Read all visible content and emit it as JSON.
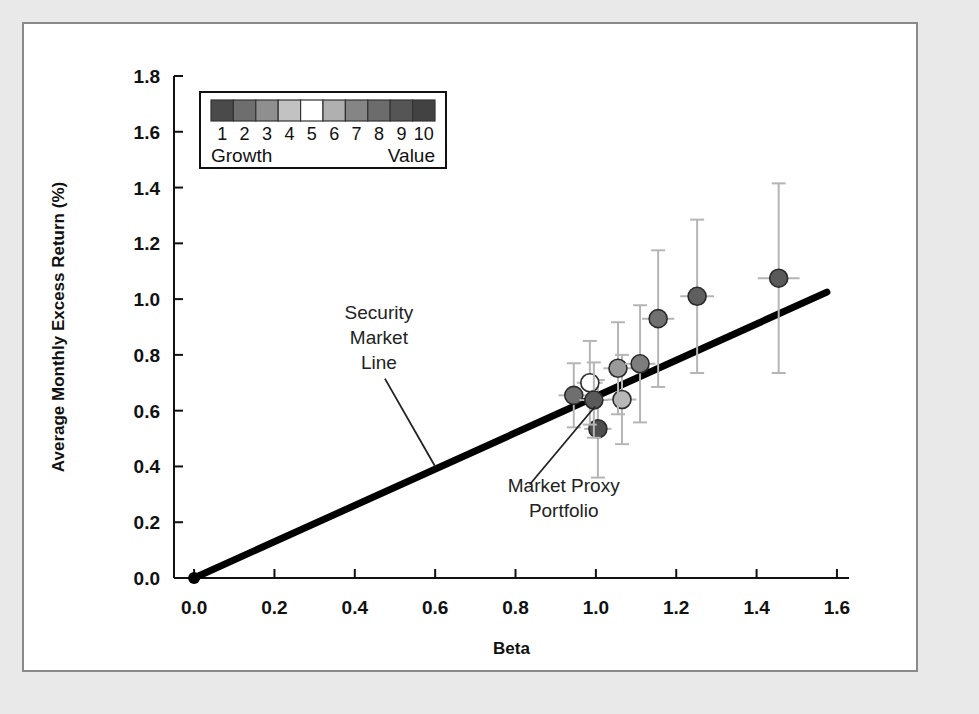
{
  "figure": {
    "background_color": "#e9e9e9",
    "panel_color": "#ffffff",
    "panel_border_color": "#8a8a8a"
  },
  "chart_data": {
    "type": "scatter",
    "title": "",
    "xlabel": "Beta",
    "ylabel": "Average Monthly Excess Return (%)",
    "xlim": [
      -0.05,
      1.63
    ],
    "ylim": [
      0.0,
      1.8
    ],
    "xticks": [
      "0.0",
      "0.2",
      "0.4",
      "0.6",
      "0.8",
      "1.0",
      "1.2",
      "1.4",
      "1.6"
    ],
    "xtick_values": [
      0.0,
      0.2,
      0.4,
      0.6,
      0.8,
      1.0,
      1.2,
      1.4,
      1.6
    ],
    "yticks": [
      "0.0",
      "0.2",
      "0.4",
      "0.6",
      "0.8",
      "1.0",
      "1.2",
      "1.4",
      "1.6",
      "1.8"
    ],
    "ytick_values": [
      0.0,
      0.2,
      0.4,
      0.6,
      0.8,
      1.0,
      1.2,
      1.4,
      1.6,
      1.8
    ],
    "grid": false,
    "legend_position": "upper-left-inside",
    "series": [
      {
        "name": "Book-to-market decile portfolios",
        "points": [
          {
            "decile": 1,
            "x": 0.945,
            "y": 0.655,
            "xerr": 0.038,
            "yerr": 0.115,
            "shade": "#6f6f6f"
          },
          {
            "decile": 2,
            "x": 1.005,
            "y": 0.535,
            "xerr": 0.034,
            "yerr": 0.175,
            "shade": "#4e4e4e"
          },
          {
            "decile": 3,
            "x": 0.985,
            "y": 0.7,
            "xerr": 0.032,
            "yerr": 0.15,
            "shade": "#ffffff"
          },
          {
            "decile": 4,
            "x": 0.995,
            "y": 0.638,
            "xerr": 0.036,
            "yerr": 0.135,
            "shade": "#5a5a5a"
          },
          {
            "decile": 5,
            "x": 1.065,
            "y": 0.64,
            "xerr": 0.036,
            "yerr": 0.16,
            "shade": "#b8b8b8"
          },
          {
            "decile": 6,
            "x": 1.055,
            "y": 0.752,
            "xerr": 0.036,
            "yerr": 0.165,
            "shade": "#9a9a9a"
          },
          {
            "decile": 7,
            "x": 1.11,
            "y": 0.768,
            "xerr": 0.038,
            "yerr": 0.21,
            "shade": "#7d7d7d"
          },
          {
            "decile": 8,
            "x": 1.155,
            "y": 0.93,
            "xerr": 0.04,
            "yerr": 0.245,
            "shade": "#707070"
          },
          {
            "decile": 9,
            "x": 1.252,
            "y": 1.01,
            "xerr": 0.042,
            "yerr": 0.275,
            "shade": "#5f5f5f"
          },
          {
            "decile": 10,
            "x": 1.455,
            "y": 1.075,
            "xerr": 0.052,
            "yerr": 0.34,
            "shade": "#5a5a5a"
          }
        ]
      }
    ],
    "line": {
      "name": "Security Market Line",
      "x0": 0.0,
      "y0": 0.0,
      "x1": 1.575,
      "y1": 1.025,
      "color": "#000000",
      "origin_marker": true
    },
    "annotations": [
      {
        "name": "security-market-line",
        "lines": [
          "Security",
          "Market",
          "Line"
        ],
        "text_x": 0.46,
        "text_y": 0.93,
        "leader_to_x": 0.6,
        "leader_to_y": 0.4
      },
      {
        "name": "market-proxy-portfolio",
        "lines": [
          "Market Proxy",
          "Portfolio"
        ],
        "text_x": 0.92,
        "text_y": 0.31,
        "leader_to_x": 0.998,
        "leader_to_y": 0.615
      }
    ]
  },
  "legend": {
    "low_label": "Growth",
    "high_label": "Value",
    "numbers": [
      "1",
      "2",
      "3",
      "4",
      "5",
      "6",
      "7",
      "8",
      "9",
      "10"
    ],
    "swatches": [
      "#4a4a4a",
      "#6e6e6e",
      "#8f8f8f",
      "#c2c2c2",
      "#ffffff",
      "#b0b0b0",
      "#858585",
      "#6c6c6c",
      "#555555",
      "#424242"
    ]
  }
}
